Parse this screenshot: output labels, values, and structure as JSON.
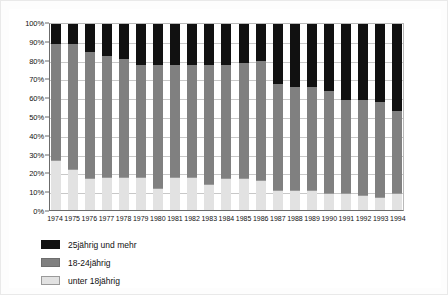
{
  "chart_data": {
    "type": "bar",
    "subtype": "stacked-percentage",
    "title": "",
    "subtitle": "",
    "xlabel": "",
    "ylabel": "",
    "ylim": [
      0,
      100
    ],
    "grid": true,
    "legend_position": "bottom-left",
    "y_ticks": [
      "0%",
      "10%",
      "20%",
      "30%",
      "40%",
      "50%",
      "60%",
      "70%",
      "80%",
      "90%",
      "100%"
    ],
    "y_tick_values": [
      0,
      10,
      20,
      30,
      40,
      50,
      60,
      70,
      80,
      90,
      100
    ],
    "categories": [
      "1974",
      "1975",
      "1976",
      "1977",
      "1978",
      "1979",
      "1980",
      "1981",
      "1982",
      "1983",
      "1984",
      "1985",
      "1986",
      "1987",
      "1988",
      "1989",
      "1990",
      "1991",
      "1992",
      "1993",
      "1994"
    ],
    "series": [
      {
        "name": "unter 18jährig",
        "color": "#e2e2e2",
        "values": [
          27,
          22,
          17,
          18,
          18,
          18,
          12,
          18,
          18,
          14,
          17,
          17,
          16,
          11,
          11,
          11,
          9,
          9,
          8,
          7,
          9
        ]
      },
      {
        "name": "18-24jährig",
        "color": "#808080",
        "values": [
          62,
          67,
          68,
          65,
          63,
          60,
          66,
          60,
          60,
          64,
          61,
          62,
          64,
          57,
          55,
          55,
          55,
          50,
          51,
          51,
          44
        ]
      },
      {
        "name": "25jährig und mehr",
        "color": "#111111",
        "values": [
          11,
          11,
          15,
          17,
          19,
          22,
          22,
          22,
          22,
          22,
          22,
          21,
          20,
          32,
          34,
          34,
          36,
          41,
          41,
          42,
          47
        ]
      }
    ],
    "cumulative_tops": {
      "unter_18": [
        27,
        22,
        17,
        18,
        18,
        18,
        12,
        18,
        18,
        14,
        17,
        17,
        16,
        11,
        11,
        11,
        9,
        9,
        8,
        7,
        9
      ],
      "through_18_24": [
        89,
        89,
        85,
        83,
        81,
        78,
        78,
        78,
        78,
        78,
        78,
        79,
        80,
        68,
        66,
        66,
        64,
        59,
        59,
        58,
        53
      ]
    }
  },
  "legend": {
    "items": [
      {
        "label": "25jährig und mehr",
        "swatch": "black"
      },
      {
        "label": "18-24jährig",
        "swatch": "gray"
      },
      {
        "label": "unter 18jährig",
        "swatch": "light-gray"
      }
    ]
  }
}
